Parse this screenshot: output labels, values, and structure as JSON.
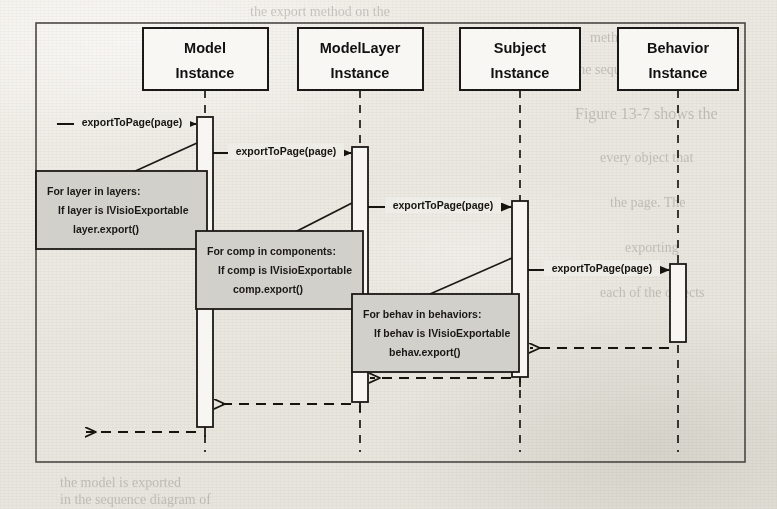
{
  "page": {
    "type": "uml-sequence-diagram",
    "background_ghost_text": [
      "the export method on the",
      "method. See the",
      "in the sequence diagram of",
      "Figure 13-7 shows the",
      "every object that",
      "the page. The",
      "exporting",
      "each of the objects",
      "the model is exported"
    ]
  },
  "diagram": {
    "lifelines": [
      {
        "id": "model",
        "line1": "Model",
        "line2": "Instance"
      },
      {
        "id": "modellayer",
        "line1": "ModelLayer",
        "line2": "Instance"
      },
      {
        "id": "subject",
        "line1": "Subject",
        "line2": "Instance"
      },
      {
        "id": "behavior",
        "line1": "Behavior",
        "line2": "Instance"
      }
    ],
    "messages": [
      {
        "id": "m1",
        "label": "exportToPage(page)",
        "from": "actor",
        "to": "model",
        "kind": "call"
      },
      {
        "id": "m2",
        "label": "exportToPage(page)",
        "from": "model",
        "to": "modellayer",
        "kind": "call"
      },
      {
        "id": "m3",
        "label": "exportToPage(page)",
        "from": "modellayer",
        "to": "subject",
        "kind": "call"
      },
      {
        "id": "m4",
        "label": "exportToPage(page)",
        "from": "subject",
        "to": "behavior",
        "kind": "call"
      }
    ],
    "returns": [
      {
        "id": "r1",
        "from": "behavior",
        "to": "subject",
        "kind": "return"
      },
      {
        "id": "r2",
        "from": "subject",
        "to": "modellayer",
        "kind": "return"
      },
      {
        "id": "r3",
        "from": "modellayer",
        "to": "model",
        "kind": "return"
      },
      {
        "id": "r4",
        "from": "model",
        "to": "actor",
        "kind": "return"
      }
    ],
    "notes": [
      {
        "id": "note-model",
        "attached_to": "model",
        "line1": "For layer in layers:",
        "line2": "If layer is IVisioExportable",
        "line3": "layer.export()"
      },
      {
        "id": "note-modellayer",
        "attached_to": "modellayer",
        "line1": "For comp in components:",
        "line2": "If comp is IVisioExportable",
        "line3": "comp.export()"
      },
      {
        "id": "note-subject",
        "attached_to": "subject",
        "line1": "For behav in behaviors:",
        "line2": "If behav is IVisioExportable",
        "line3": "behav.export()"
      }
    ],
    "colors": {
      "stroke": "#1b1917",
      "note_fill": "#d2d0cb",
      "frame": "#4a4845",
      "paper": "#eceae4"
    }
  }
}
